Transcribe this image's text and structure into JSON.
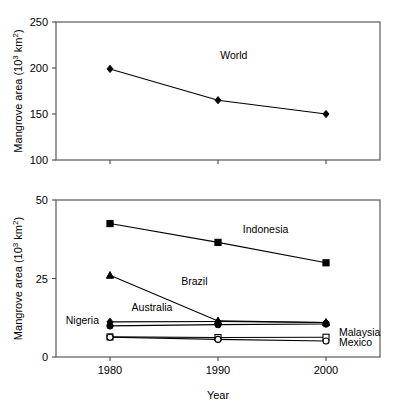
{
  "figure": {
    "background": "#ffffff",
    "ink_color": "#000000",
    "axis_color": "#4a4a4a"
  },
  "chart_data": [
    {
      "id": "panel-top",
      "type": "line",
      "title": "",
      "xlabel": "",
      "ylabel": "Mangrove area (10³ km²)",
      "ylabel_parts": {
        "main": "Mangrove area (10",
        "sup": "3",
        "tail": " km",
        "sup2": "2",
        "close": ")"
      },
      "x": [
        1980,
        1990,
        2000
      ],
      "xticklabels": [
        "1980",
        "1990",
        "2000"
      ],
      "xlim": [
        1975,
        2005
      ],
      "ylim": [
        100,
        250
      ],
      "yticks": [
        100,
        150,
        200,
        250
      ],
      "yticklabels": [
        "100",
        "150",
        "200",
        "250"
      ],
      "grid": false,
      "legend": "inline-annotations",
      "series": [
        {
          "name": "World",
          "label": "World",
          "marker": "filled-diamond",
          "values": [
            199,
            165,
            150
          ],
          "label_pos": {
            "x": 1990.2,
            "y": 210
          }
        }
      ]
    },
    {
      "id": "panel-bottom",
      "type": "line",
      "title": "",
      "xlabel": "Year",
      "ylabel": "Mangrove area (10³ km²)",
      "ylabel_parts": {
        "main": "Mangrove area (10",
        "sup": "3",
        "tail": " km",
        "sup2": "2",
        "close": ")"
      },
      "x": [
        1980,
        1990,
        2000
      ],
      "xticklabels": [
        "1980",
        "1990",
        "2000"
      ],
      "xlim": [
        1975,
        2005
      ],
      "ylim": [
        0,
        50
      ],
      "yticks": [
        0,
        25,
        50
      ],
      "yticklabels": [
        "0",
        "25",
        "50"
      ],
      "grid": false,
      "legend": "inline-annotations",
      "series": [
        {
          "name": "Indonesia",
          "label": "Indonesia",
          "marker": "filled-square",
          "values": [
            42.5,
            36.5,
            30.0
          ],
          "label_pos": {
            "x": 1992.3,
            "y": 39.5
          }
        },
        {
          "name": "Brazil",
          "label": "Brazil",
          "marker": "filled-triangle",
          "values": [
            26.0,
            11.5,
            11.0
          ],
          "label_pos": {
            "x": 1986.6,
            "y": 23.0
          }
        },
        {
          "name": "Australia",
          "label": "Australia",
          "marker": "filled-diamond",
          "values": [
            11.2,
            11.3,
            11.0
          ],
          "label_pos": {
            "x": 1982.0,
            "y": 14.6
          }
        },
        {
          "name": "Nigeria",
          "label": "Nigeria",
          "marker": "filled-circle",
          "values": [
            9.9,
            10.3,
            10.5
          ],
          "label_pos": {
            "x": 1975.9,
            "y": 10.4
          }
        },
        {
          "name": "Malaysia",
          "label": "Malaysia",
          "marker": "open-square",
          "values": [
            6.4,
            6.2,
            6.3
          ],
          "label_pos": {
            "x": 2001.2,
            "y": 6.6
          }
        },
        {
          "name": "Mexico",
          "label": "Mexico",
          "marker": "open-circle",
          "values": [
            6.3,
            5.6,
            5.1
          ],
          "label_pos": {
            "x": 2001.2,
            "y": 3.6
          }
        }
      ]
    }
  ]
}
